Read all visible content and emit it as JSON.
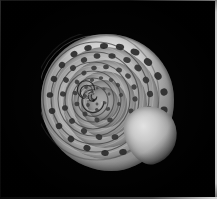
{
  "image": {
    "subject": "snail shell",
    "view": "apical (top-down) view of a coiled gastropod shell",
    "medium": "grayscale photograph",
    "background_color": "#000000",
    "border_color": "#d8d8d8",
    "width_px": 217,
    "height_px": 199,
    "alt_text": "Grayscale photograph of a spiral snail shell viewed from above on a black background"
  },
  "shell": {
    "coil_direction": "clockwise inward (dextral)",
    "whorl_count": 6,
    "center_x_px": 93,
    "center_y_px": 101,
    "left_px": 41,
    "top_px": 34,
    "width_px": 133,
    "height_px": 137,
    "highlight_color": "#e2e2e2",
    "midtone_color": "#a8a8a8",
    "shadow_color": "#4b4b4b",
    "spot_color": "#2b2b2b",
    "features": [
      {
        "name": "body-whorl",
        "label": "Body whorl"
      },
      {
        "name": "outer-highlight",
        "label": "Outer rim highlight"
      },
      {
        "name": "whorl-ring-2",
        "label": "Second whorl"
      },
      {
        "name": "whorl-ring-3",
        "label": "Third whorl"
      },
      {
        "name": "whorl-ring-4",
        "label": "Fourth whorl"
      },
      {
        "name": "whorl-ring-5",
        "label": "Fifth whorl"
      },
      {
        "name": "whorl-ring-6",
        "label": "Sixth whorl"
      },
      {
        "name": "apex-spiral",
        "label": "Apex spiral"
      },
      {
        "name": "aperture-lobe",
        "label": "Aperture lip lobe"
      }
    ]
  },
  "border": {
    "right_edge_color": "#d8d8d8",
    "bottom_edge_color": "#d8d8d8"
  }
}
